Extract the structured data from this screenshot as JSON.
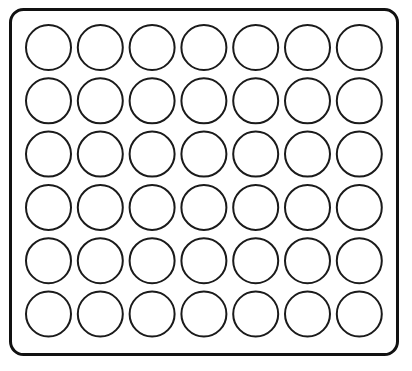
{
  "canvas": {
    "width": 412,
    "height": 371,
    "background_color": "#ffffff"
  },
  "tray": {
    "name": "well-plate-tray",
    "shape": "rounded-rectangle",
    "x": 10.5,
    "y": 9.5,
    "width": 387,
    "height": 345,
    "corner_radius": 13,
    "stroke_color": "#111111",
    "stroke_width": 3,
    "fill_color": "#ffffff"
  },
  "grid": {
    "rows": 6,
    "columns": 7,
    "total_wells": 42,
    "circle_diameter": 45,
    "circle_radius": 22.5,
    "column_pitch": 51.8,
    "row_pitch": 53.3,
    "first_center_x": 48.5,
    "first_center_y": 47.5,
    "circle_stroke_color": "#1a1a1a",
    "circle_stroke_width": 2,
    "circle_fill_color": "#ffffff",
    "row_labels": [
      "A",
      "B",
      "C",
      "D",
      "E",
      "F"
    ],
    "column_labels": [
      "1",
      "2",
      "3",
      "4",
      "5",
      "6",
      "7"
    ]
  },
  "chart_data": {
    "type": "scatter",
    "title": "",
    "xlabel": "",
    "ylabel": "",
    "grid": false,
    "legend": "none",
    "xlim": [
      0,
      412
    ],
    "ylim": [
      371,
      0
    ],
    "marker": "circle-outline",
    "marker_size": 45,
    "points": [
      {
        "id": "A1",
        "row": "A",
        "col": 1,
        "cx": 48.5,
        "cy": 47.5,
        "r": 22.5
      },
      {
        "id": "A2",
        "row": "A",
        "col": 2,
        "cx": 100.3,
        "cy": 47.5,
        "r": 22.5
      },
      {
        "id": "A3",
        "row": "A",
        "col": 3,
        "cx": 152.1,
        "cy": 47.5,
        "r": 22.5
      },
      {
        "id": "A4",
        "row": "A",
        "col": 4,
        "cx": 203.9,
        "cy": 47.5,
        "r": 22.5
      },
      {
        "id": "A5",
        "row": "A",
        "col": 5,
        "cx": 255.7,
        "cy": 47.5,
        "r": 22.5
      },
      {
        "id": "A6",
        "row": "A",
        "col": 6,
        "cx": 307.5,
        "cy": 47.5,
        "r": 22.5
      },
      {
        "id": "A7",
        "row": "A",
        "col": 7,
        "cx": 359.3,
        "cy": 47.5,
        "r": 22.5
      },
      {
        "id": "B1",
        "row": "B",
        "col": 1,
        "cx": 48.5,
        "cy": 100.8,
        "r": 22.5
      },
      {
        "id": "B2",
        "row": "B",
        "col": 2,
        "cx": 100.3,
        "cy": 100.8,
        "r": 22.5
      },
      {
        "id": "B3",
        "row": "B",
        "col": 3,
        "cx": 152.1,
        "cy": 100.8,
        "r": 22.5
      },
      {
        "id": "B4",
        "row": "B",
        "col": 4,
        "cx": 203.9,
        "cy": 100.8,
        "r": 22.5
      },
      {
        "id": "B5",
        "row": "B",
        "col": 5,
        "cx": 255.7,
        "cy": 100.8,
        "r": 22.5
      },
      {
        "id": "B6",
        "row": "B",
        "col": 6,
        "cx": 307.5,
        "cy": 100.8,
        "r": 22.5
      },
      {
        "id": "B7",
        "row": "B",
        "col": 7,
        "cx": 359.3,
        "cy": 100.8,
        "r": 22.5
      },
      {
        "id": "C1",
        "row": "C",
        "col": 1,
        "cx": 48.5,
        "cy": 154.1,
        "r": 22.5
      },
      {
        "id": "C2",
        "row": "C",
        "col": 2,
        "cx": 100.3,
        "cy": 154.1,
        "r": 22.5
      },
      {
        "id": "C3",
        "row": "C",
        "col": 3,
        "cx": 152.1,
        "cy": 154.1,
        "r": 22.5
      },
      {
        "id": "C4",
        "row": "C",
        "col": 4,
        "cx": 203.9,
        "cy": 154.1,
        "r": 22.5
      },
      {
        "id": "C5",
        "row": "C",
        "col": 5,
        "cx": 255.7,
        "cy": 154.1,
        "r": 22.5
      },
      {
        "id": "C6",
        "row": "C",
        "col": 6,
        "cx": 307.5,
        "cy": 154.1,
        "r": 22.5
      },
      {
        "id": "C7",
        "row": "C",
        "col": 7,
        "cx": 359.3,
        "cy": 154.1,
        "r": 22.5
      },
      {
        "id": "D1",
        "row": "D",
        "col": 1,
        "cx": 48.5,
        "cy": 207.4,
        "r": 22.5
      },
      {
        "id": "D2",
        "row": "D",
        "col": 2,
        "cx": 100.3,
        "cy": 207.4,
        "r": 22.5
      },
      {
        "id": "D3",
        "row": "D",
        "col": 3,
        "cx": 152.1,
        "cy": 207.4,
        "r": 22.5
      },
      {
        "id": "D4",
        "row": "D",
        "col": 4,
        "cx": 203.9,
        "cy": 207.4,
        "r": 22.5
      },
      {
        "id": "D5",
        "row": "D",
        "col": 5,
        "cx": 255.7,
        "cy": 207.4,
        "r": 22.5
      },
      {
        "id": "D6",
        "row": "D",
        "col": 6,
        "cx": 307.5,
        "cy": 207.4,
        "r": 22.5
      },
      {
        "id": "D7",
        "row": "D",
        "col": 7,
        "cx": 359.3,
        "cy": 207.4,
        "r": 22.5
      },
      {
        "id": "E1",
        "row": "E",
        "col": 1,
        "cx": 48.5,
        "cy": 260.7,
        "r": 22.5
      },
      {
        "id": "E2",
        "row": "E",
        "col": 2,
        "cx": 100.3,
        "cy": 260.7,
        "r": 22.5
      },
      {
        "id": "E3",
        "row": "E",
        "col": 3,
        "cx": 152.1,
        "cy": 260.7,
        "r": 22.5
      },
      {
        "id": "E4",
        "row": "E",
        "col": 4,
        "cx": 203.9,
        "cy": 260.7,
        "r": 22.5
      },
      {
        "id": "E5",
        "row": "E",
        "col": 5,
        "cx": 255.7,
        "cy": 260.7,
        "r": 22.5
      },
      {
        "id": "E6",
        "row": "E",
        "col": 6,
        "cx": 307.5,
        "cy": 260.7,
        "r": 22.5
      },
      {
        "id": "E7",
        "row": "E",
        "col": 7,
        "cx": 359.3,
        "cy": 260.7,
        "r": 22.5
      },
      {
        "id": "F1",
        "row": "F",
        "col": 1,
        "cx": 48.5,
        "cy": 314.0,
        "r": 22.5
      },
      {
        "id": "F2",
        "row": "F",
        "col": 2,
        "cx": 100.3,
        "cy": 314.0,
        "r": 22.5
      },
      {
        "id": "F3",
        "row": "F",
        "col": 3,
        "cx": 152.1,
        "cy": 314.0,
        "r": 22.5
      },
      {
        "id": "F4",
        "row": "F",
        "col": 4,
        "cx": 203.9,
        "cy": 314.0,
        "r": 22.5
      },
      {
        "id": "F5",
        "row": "F",
        "col": 5,
        "cx": 255.7,
        "cy": 314.0,
        "r": 22.5
      },
      {
        "id": "F6",
        "row": "F",
        "col": 6,
        "cx": 307.5,
        "cy": 314.0,
        "r": 22.5
      },
      {
        "id": "F7",
        "row": "F",
        "col": 7,
        "cx": 359.3,
        "cy": 314.0,
        "r": 22.5
      }
    ]
  }
}
